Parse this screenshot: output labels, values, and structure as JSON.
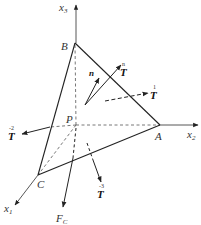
{
  "figure": {
    "axes": {
      "x1": {
        "label": "x",
        "subscript": "1"
      },
      "x2": {
        "label": "x",
        "subscript": "2"
      },
      "x3": {
        "label": "x",
        "subscript": "3"
      }
    },
    "vertices": {
      "A": "A",
      "B": "B",
      "C": "C",
      "P": "P"
    },
    "vectors": {
      "normal": {
        "label": "n"
      },
      "traction_n": {
        "label": "T",
        "superscript": "n"
      },
      "traction_1": {
        "label": "T",
        "superscript": "1"
      },
      "traction_2": {
        "label": "T",
        "superscript": "-2"
      },
      "traction_3": {
        "label": "T",
        "superscript": "-3"
      },
      "body_force": {
        "label": "F",
        "subscript": "C"
      }
    }
  },
  "colors": {
    "line": "#222222",
    "dashed": "#555555",
    "text": "#333333"
  }
}
